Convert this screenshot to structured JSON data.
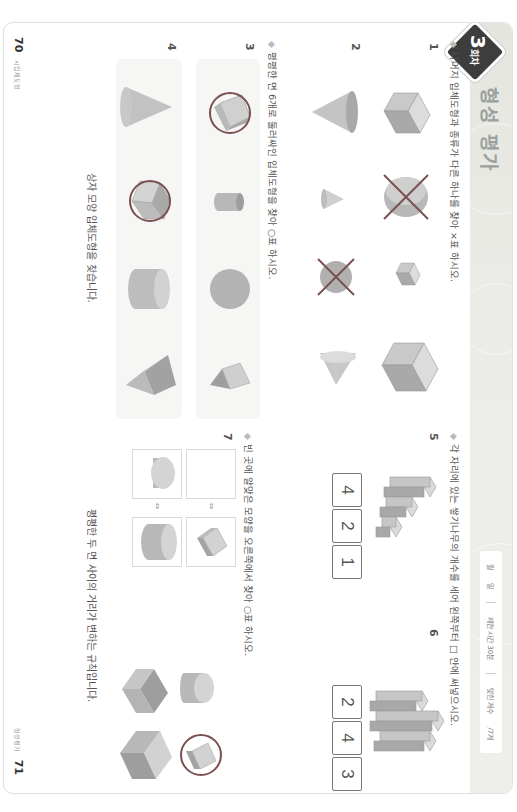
{
  "header": {
    "badge_number": "3",
    "badge_suffix": "회차",
    "title": "형성 평가",
    "pill": {
      "date_month": "월",
      "date_day": "일",
      "time_limit": "제한 시간 30분",
      "score_label": "맞힌 개수",
      "score_total": "/7개"
    },
    "band_color": "#e8e9e4",
    "badge_color": "#3d3d3d"
  },
  "left": {
    "instruction1": "나머지 입체도형과 종류가 다른 하나를 찾아 ×표 하시오.",
    "q1": {
      "number": "1",
      "shapes": [
        "cube",
        "cylinder-crossed",
        "small-cube",
        "large-cube"
      ],
      "marked_index": 1,
      "mark": "×"
    },
    "q2": {
      "number": "2",
      "shapes": [
        "cone-down",
        "small-cone",
        "sphere-crossed",
        "cone-side"
      ],
      "marked_index": 2,
      "mark": "×"
    },
    "instruction2": "평평한 면 6개로 둘러싸인 입체도형을 찾아 ○표 하시오.",
    "q3": {
      "number": "3",
      "shapes": [
        "box-circled",
        "small-cylinder",
        "sphere",
        "pyramid"
      ],
      "marked_index": 0,
      "mark": "○"
    },
    "q4": {
      "number": "4",
      "shapes": [
        "cone",
        "cube-circled",
        "cylinder",
        "pyramid"
      ],
      "marked_index": 1,
      "mark": "○"
    },
    "hint": "상자 모양 입체도형을 찾습니다."
  },
  "right": {
    "instruction3": "각 자리에 있는 쌓기나무의 개수를 세어 왼쪽부터 □ 안에 써넣으시오.",
    "q5": {
      "number": "5",
      "answers": [
        "4",
        "2",
        "1"
      ]
    },
    "q6": {
      "number": "6",
      "answers": [
        "2",
        "4",
        "3"
      ]
    },
    "instruction4": "빈 곳에 알맞은 모양을 오른쪽에서 찾아 ○표 하시오.",
    "q7": {
      "number": "7",
      "pairs": [
        [
          "empty",
          "thin-box"
        ],
        [
          "thin-cylinder",
          "wide-cylinder"
        ]
      ],
      "options": [
        "cylinder",
        "thin-box-circled",
        "box",
        "large-box"
      ],
      "circled_index": 1
    },
    "hint": "평평한 두 면 사이의 거리가 변하는 규칙입니다."
  },
  "footer": {
    "left_page": "70",
    "left_label": "시입체도형",
    "right_page": "71",
    "right_label": "형성평가"
  },
  "colors": {
    "mark": "#7a5050",
    "shape_light": "#d6d6d6",
    "shape_mid": "#bdbdbd",
    "shape_dark": "#9c9c9c"
  }
}
